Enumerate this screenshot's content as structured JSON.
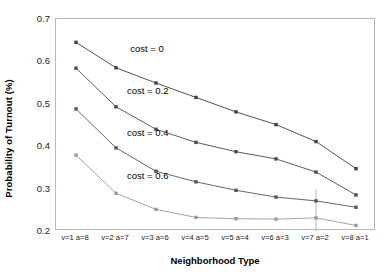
{
  "chart_data": {
    "type": "line",
    "title": "",
    "xlabel": "Neighborhood Type",
    "ylabel": "Probability of Turnout (%)",
    "categories": [
      "v=1 a=8",
      "v=2 a=7",
      "v=3 a=6",
      "v=4 a=5",
      "v=5 a=4",
      "v=6 a=3",
      "v=7 a=2",
      "v=8 a=1"
    ],
    "ylim": [
      0.2,
      0.7
    ],
    "yticks": [
      "0.2",
      "0.3",
      "0.4",
      "0.5",
      "0.6",
      "0.7"
    ],
    "ytick_values": [
      0.2,
      0.3,
      0.4,
      0.5,
      0.6,
      0.7
    ],
    "grid": false,
    "legend_position": "inline-annotations",
    "series": [
      {
        "name": "cost = 0",
        "label": "cost = 0",
        "color": "#404040",
        "marker": "square",
        "values": [
          0.645,
          0.585,
          0.549,
          0.515,
          0.481,
          0.451,
          0.411,
          0.347
        ]
      },
      {
        "name": "cost = 0.2",
        "label": "cost = 0.2",
        "color": "#4a4a4a",
        "marker": "square",
        "values": [
          0.584,
          0.493,
          0.44,
          0.409,
          0.387,
          0.37,
          0.339,
          0.285
        ]
      },
      {
        "name": "cost = 0.4",
        "label": "cost = 0.4",
        "color": "#555555",
        "marker": "square",
        "values": [
          0.488,
          0.396,
          0.341,
          0.316,
          0.296,
          0.28,
          0.271,
          0.256
        ]
      },
      {
        "name": "cost = 0.6",
        "label": "cost = 0.6",
        "color": "#9a9a9a",
        "marker": "square",
        "values": [
          0.379,
          0.289,
          0.251,
          0.232,
          0.229,
          0.228,
          0.231,
          0.213
        ]
      }
    ],
    "annotations": [
      {
        "text": "cost = 0",
        "x_frac": 0.235,
        "y_value": 0.628
      },
      {
        "text": "cost = 0.2",
        "x_frac": 0.225,
        "y_value": 0.527
      },
      {
        "text": "cost = 0.4",
        "x_frac": 0.225,
        "y_value": 0.428
      },
      {
        "text": "cost = 0.6",
        "x_frac": 0.225,
        "y_value": 0.327
      }
    ]
  }
}
